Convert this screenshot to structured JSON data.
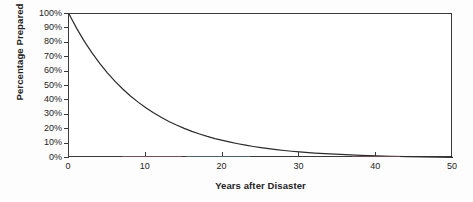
{
  "chart_data": {
    "type": "line",
    "title": "",
    "xlabel": "Years after Disaster",
    "ylabel": "Percentage Prepared",
    "xlim": [
      0,
      50
    ],
    "ylim": [
      0,
      100
    ],
    "grid": false,
    "legend": null,
    "xticks": [
      0,
      10,
      20,
      30,
      40,
      50
    ],
    "xtick_labels": [
      "0",
      "10",
      "20",
      "30",
      "40",
      "50"
    ],
    "yticks": [
      0,
      10,
      20,
      30,
      40,
      50,
      60,
      70,
      80,
      90,
      100
    ],
    "ytick_labels": [
      "0%",
      "10%",
      "20%",
      "30%",
      "40%",
      "50%",
      "60%",
      "70%",
      "80%",
      "90%",
      "100%"
    ],
    "series": [
      {
        "name": "Percentage Prepared",
        "color": "#2b2b2b",
        "x": [
          0,
          1,
          2,
          3,
          4,
          5,
          6,
          7,
          8,
          9,
          10,
          11,
          12,
          13,
          14,
          15,
          16,
          17,
          18,
          19,
          20,
          21,
          22,
          23,
          24,
          25,
          26,
          27,
          28,
          29,
          30,
          32,
          34,
          36,
          38,
          40,
          42,
          44,
          46,
          48,
          50
        ],
        "values": [
          100,
          90,
          81,
          73,
          65.7,
          59.1,
          53.2,
          47.9,
          43.1,
          38.8,
          34.9,
          31.4,
          28.3,
          25.4,
          22.9,
          20.6,
          18.5,
          16.7,
          15,
          13.5,
          12.2,
          11,
          9.9,
          8.9,
          8,
          7.2,
          6.5,
          5.8,
          5.2,
          4.7,
          4.2,
          3.4,
          2.8,
          2.3,
          1.8,
          1.5,
          1.2,
          1,
          0.8,
          0.6,
          0.5
        ]
      }
    ]
  },
  "axes": {
    "y_title": "Percentage Prepared",
    "x_title": "Years after Disaster"
  }
}
